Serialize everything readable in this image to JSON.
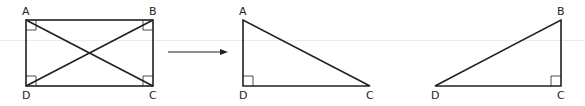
{
  "diagram": {
    "colors": {
      "stroke": "#231f20",
      "background": "#ffffff",
      "guide": "#ececec"
    },
    "rectangle": {
      "vertices": {
        "A": [
          26,
          20
        ],
        "B": [
          153,
          20
        ],
        "C": [
          153,
          86
        ],
        "D": [
          26,
          86
        ]
      },
      "labels": {
        "A": "A",
        "B": "B",
        "C": "C",
        "D": "D"
      },
      "diagonals": [
        "AC",
        "BD"
      ],
      "right_angle_marks": [
        "A",
        "B",
        "C",
        "D"
      ]
    },
    "arrow": {
      "from": [
        168,
        52
      ],
      "to": [
        227,
        52
      ]
    },
    "triangle_adc": {
      "vertices": {
        "A": [
          243,
          20
        ],
        "D": [
          243,
          86
        ],
        "C": [
          370,
          86
        ]
      },
      "labels": {
        "A": "A",
        "D": "D",
        "C": "C"
      },
      "right_angle_marks": [
        "D"
      ]
    },
    "triangle_dcb": {
      "vertices": {
        "D": [
          435,
          86
        ],
        "C": [
          561,
          86
        ],
        "B": [
          561,
          20
        ]
      },
      "labels": {
        "D": "D",
        "C": "C",
        "B": "B"
      },
      "right_angle_marks": [
        "C"
      ]
    }
  }
}
